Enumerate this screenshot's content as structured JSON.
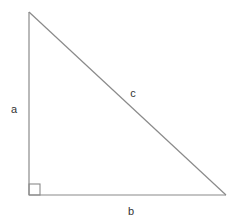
{
  "diagram": {
    "type": "right-triangle",
    "line_color": "#8a8a8a",
    "label_color": "#333333",
    "vertices": {
      "top": [
        29,
        12
      ],
      "right_angle": [
        29,
        195
      ],
      "right": [
        226,
        195
      ]
    },
    "right_angle_marker_size": 11,
    "labels": {
      "a": "a",
      "b": "b",
      "c": "c"
    },
    "label_positions": {
      "a": [
        14,
        109
      ],
      "b": [
        131,
        211
      ],
      "c": [
        133,
        93
      ]
    }
  }
}
